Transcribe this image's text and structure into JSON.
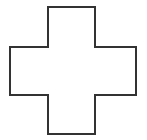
{
  "figure": {
    "name": "plus-cross-outline",
    "background_color": "#ffffff",
    "fill_color": "#ffffff",
    "stroke_color": "#333333",
    "stroke_width": 2,
    "canvas": {
      "width": 147,
      "height": 140
    },
    "geometry": {
      "vertical_bar": {
        "x1": 48,
        "x2": 95,
        "y1": 7,
        "y2": 134
      },
      "horizontal_bar": {
        "x1": 10,
        "x2": 136,
        "y1": 47,
        "y2": 95
      }
    },
    "path": "M 48 7 L 95 7 L 95 47 L 136 47 L 136 95 L 95 95 L 95 134 L 48 134 L 48 95 L 10 95 L 10 47 L 48 47 Z",
    "points": [
      {
        "x": 48,
        "y": 7
      },
      {
        "x": 95,
        "y": 7
      },
      {
        "x": 95,
        "y": 47
      },
      {
        "x": 136,
        "y": 47
      },
      {
        "x": 136,
        "y": 95
      },
      {
        "x": 95,
        "y": 95
      },
      {
        "x": 95,
        "y": 134
      },
      {
        "x": 48,
        "y": 134
      },
      {
        "x": 48,
        "y": 95
      },
      {
        "x": 10,
        "y": 95
      },
      {
        "x": 10,
        "y": 47
      },
      {
        "x": 48,
        "y": 47
      }
    ]
  }
}
